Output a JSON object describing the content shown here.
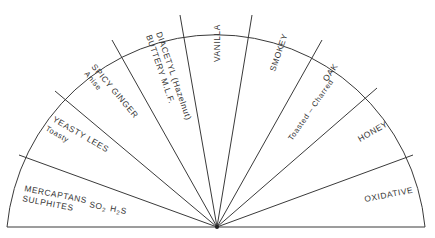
{
  "diagram": {
    "type": "semicircle-wheel",
    "center": [
      217,
      227
    ],
    "radius": 213,
    "stroke_color": "#3a3a3a",
    "text_color": "#333333",
    "sectors": [
      {
        "id": "mercaptans",
        "lines": [
          "MERCAPTANS",
          "SULPHITES"
        ],
        "extra": {
          "so2": "SO",
          "so2_sub": "2",
          "h2s_a": "H",
          "h2s_sub": "2",
          "h2s_b": "S"
        }
      },
      {
        "id": "yeasty-lees",
        "lines": [
          "YEASTY LEES",
          "Toasty"
        ]
      },
      {
        "id": "spicy-ginger",
        "lines": [
          "SPICY GINGER",
          "Anise"
        ]
      },
      {
        "id": "diacetyl",
        "lines": [
          "DIACETYL (Hazelnut)",
          "BUTTERY M.L.F."
        ]
      },
      {
        "id": "vanilla",
        "lines": [
          "VANILLA"
        ]
      },
      {
        "id": "smokey",
        "lines": [
          "SMOKEY"
        ]
      },
      {
        "id": "oak",
        "lines": [
          "OAK",
          "Toasted – Charred"
        ]
      },
      {
        "id": "honey",
        "lines": [
          "HONEY"
        ]
      },
      {
        "id": "oxidative",
        "lines": [
          "OXIDATIVE"
        ]
      }
    ]
  }
}
